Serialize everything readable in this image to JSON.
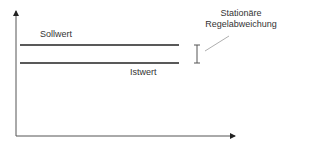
{
  "diagram": {
    "title": "",
    "labels": {
      "setpoint": "Sollwert",
      "actual": "Istwert",
      "callout_line1": "Stationäre",
      "callout_line2": "Regelabweichung"
    },
    "elements": {
      "y_axis": {
        "x": 16,
        "y_top": 10,
        "y_bottom": 136
      },
      "x_axis": {
        "y": 136,
        "x_left": 16,
        "x_right": 236
      },
      "setpoint_line": {
        "y": 45,
        "x_start": 20,
        "x_end": 179
      },
      "actual_line": {
        "y": 63,
        "x_start": 20,
        "x_end": 179
      },
      "deviation_marker": {
        "x": 197,
        "y_top": 45,
        "y_bottom": 63
      },
      "leader_line": {
        "x1": 205,
        "y1": 50,
        "x2": 229,
        "y2": 36
      }
    },
    "colors": {
      "line": "#222222",
      "axis": "#444444",
      "marker": "#555555",
      "leader": "#999999",
      "text": "#333333"
    }
  }
}
